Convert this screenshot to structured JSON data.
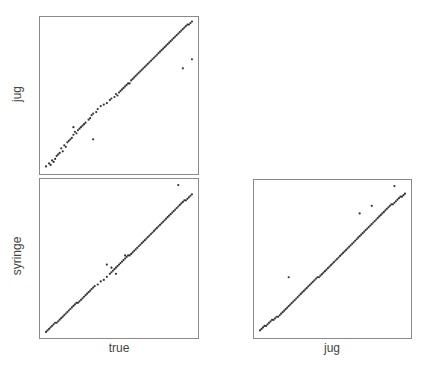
{
  "chart_data": [
    {
      "type": "scatter",
      "panel": "top-left",
      "xlabel": "true",
      "ylabel": "jug",
      "title": "",
      "grid": false,
      "ticks": false,
      "x": [
        0.02,
        0.04,
        0.05,
        0.06,
        0.07,
        0.08,
        0.09,
        0.1,
        0.11,
        0.12,
        0.13,
        0.14,
        0.15,
        0.16,
        0.17,
        0.18,
        0.19,
        0.2,
        0.21,
        0.22,
        0.23,
        0.24,
        0.25,
        0.26,
        0.27,
        0.28,
        0.3,
        0.31,
        0.32,
        0.33,
        0.35,
        0.36,
        0.38,
        0.4,
        0.42,
        0.44,
        0.45,
        0.47,
        0.48,
        0.49,
        0.5,
        0.51,
        0.52,
        0.53,
        0.54,
        0.55,
        0.56,
        0.57,
        0.58,
        0.59,
        0.6,
        0.61,
        0.62,
        0.63,
        0.64,
        0.65,
        0.66,
        0.67,
        0.68,
        0.69,
        0.7,
        0.71,
        0.72,
        0.73,
        0.74,
        0.75,
        0.76,
        0.77,
        0.78,
        0.79,
        0.8,
        0.81,
        0.82,
        0.83,
        0.84,
        0.85,
        0.86,
        0.87,
        0.88,
        0.89,
        0.9,
        0.91,
        0.92,
        0.93,
        0.94,
        0.95,
        0.96,
        0.97,
        0.98,
        0.33,
        0.92,
        0.98,
        0.2
      ],
      "y": [
        0.03,
        0.05,
        0.04,
        0.07,
        0.06,
        0.08,
        0.1,
        0.11,
        0.12,
        0.15,
        0.13,
        0.17,
        0.16,
        0.19,
        0.2,
        0.21,
        0.22,
        0.24,
        0.26,
        0.25,
        0.27,
        0.28,
        0.29,
        0.3,
        0.31,
        0.32,
        0.34,
        0.35,
        0.37,
        0.38,
        0.39,
        0.41,
        0.43,
        0.44,
        0.45,
        0.47,
        0.48,
        0.49,
        0.51,
        0.5,
        0.52,
        0.53,
        0.54,
        0.55,
        0.56,
        0.57,
        0.58,
        0.58,
        0.6,
        0.61,
        0.62,
        0.63,
        0.64,
        0.65,
        0.66,
        0.67,
        0.68,
        0.69,
        0.7,
        0.71,
        0.72,
        0.73,
        0.74,
        0.75,
        0.76,
        0.77,
        0.78,
        0.79,
        0.8,
        0.81,
        0.82,
        0.83,
        0.84,
        0.85,
        0.86,
        0.87,
        0.88,
        0.89,
        0.9,
        0.91,
        0.92,
        0.93,
        0.94,
        0.95,
        0.96,
        0.97,
        0.97,
        0.98,
        0.99,
        0.21,
        0.68,
        0.74,
        0.29
      ]
    },
    {
      "type": "scatter",
      "panel": "bottom-left",
      "xlabel": "true",
      "ylabel": "syringe",
      "title": "",
      "grid": false,
      "ticks": false,
      "x": [
        0.02,
        0.03,
        0.04,
        0.05,
        0.06,
        0.07,
        0.08,
        0.09,
        0.1,
        0.11,
        0.12,
        0.13,
        0.14,
        0.15,
        0.16,
        0.17,
        0.18,
        0.19,
        0.2,
        0.21,
        0.22,
        0.23,
        0.24,
        0.25,
        0.26,
        0.27,
        0.28,
        0.29,
        0.3,
        0.31,
        0.32,
        0.33,
        0.34,
        0.36,
        0.38,
        0.4,
        0.42,
        0.44,
        0.45,
        0.46,
        0.47,
        0.48,
        0.49,
        0.5,
        0.51,
        0.52,
        0.53,
        0.54,
        0.55,
        0.56,
        0.57,
        0.58,
        0.59,
        0.6,
        0.61,
        0.62,
        0.63,
        0.64,
        0.65,
        0.66,
        0.67,
        0.68,
        0.69,
        0.7,
        0.71,
        0.72,
        0.73,
        0.74,
        0.75,
        0.76,
        0.77,
        0.78,
        0.79,
        0.8,
        0.81,
        0.82,
        0.83,
        0.84,
        0.85,
        0.86,
        0.87,
        0.88,
        0.89,
        0.9,
        0.91,
        0.92,
        0.93,
        0.94,
        0.95,
        0.96,
        0.97,
        0.98,
        0.89,
        0.42,
        0.45,
        0.54,
        0.48
      ],
      "y": [
        0.02,
        0.03,
        0.04,
        0.05,
        0.06,
        0.07,
        0.08,
        0.08,
        0.09,
        0.1,
        0.11,
        0.12,
        0.13,
        0.14,
        0.15,
        0.16,
        0.17,
        0.18,
        0.19,
        0.2,
        0.21,
        0.21,
        0.22,
        0.23,
        0.24,
        0.25,
        0.26,
        0.27,
        0.28,
        0.29,
        0.3,
        0.31,
        0.32,
        0.33,
        0.35,
        0.36,
        0.38,
        0.4,
        0.41,
        0.42,
        0.43,
        0.44,
        0.45,
        0.46,
        0.47,
        0.48,
        0.49,
        0.5,
        0.51,
        0.52,
        0.52,
        0.53,
        0.54,
        0.55,
        0.56,
        0.57,
        0.58,
        0.59,
        0.6,
        0.61,
        0.62,
        0.63,
        0.64,
        0.65,
        0.66,
        0.67,
        0.68,
        0.69,
        0.7,
        0.71,
        0.72,
        0.73,
        0.74,
        0.75,
        0.76,
        0.77,
        0.78,
        0.79,
        0.8,
        0.81,
        0.82,
        0.83,
        0.84,
        0.85,
        0.86,
        0.87,
        0.88,
        0.88,
        0.89,
        0.9,
        0.91,
        0.92,
        0.98,
        0.46,
        0.44,
        0.52,
        0.4
      ]
    },
    {
      "type": "scatter",
      "panel": "bottom-right",
      "xlabel": "jug",
      "ylabel": "syringe",
      "title": "",
      "grid": false,
      "ticks": false,
      "x": [
        0.02,
        0.03,
        0.04,
        0.05,
        0.06,
        0.07,
        0.08,
        0.09,
        0.1,
        0.11,
        0.12,
        0.13,
        0.14,
        0.15,
        0.16,
        0.17,
        0.18,
        0.19,
        0.2,
        0.21,
        0.22,
        0.23,
        0.24,
        0.25,
        0.26,
        0.27,
        0.28,
        0.29,
        0.3,
        0.31,
        0.32,
        0.33,
        0.34,
        0.35,
        0.36,
        0.37,
        0.38,
        0.39,
        0.4,
        0.41,
        0.42,
        0.43,
        0.44,
        0.45,
        0.46,
        0.47,
        0.48,
        0.49,
        0.5,
        0.51,
        0.52,
        0.53,
        0.54,
        0.55,
        0.56,
        0.57,
        0.58,
        0.59,
        0.6,
        0.61,
        0.62,
        0.63,
        0.64,
        0.65,
        0.66,
        0.67,
        0.68,
        0.69,
        0.7,
        0.71,
        0.72,
        0.73,
        0.74,
        0.75,
        0.76,
        0.77,
        0.78,
        0.79,
        0.8,
        0.81,
        0.82,
        0.83,
        0.84,
        0.85,
        0.86,
        0.87,
        0.88,
        0.89,
        0.9,
        0.91,
        0.92,
        0.93,
        0.94,
        0.95,
        0.96,
        0.97,
        0.98,
        0.21,
        0.68,
        0.76,
        0.91
      ],
      "y": [
        0.03,
        0.04,
        0.05,
        0.06,
        0.06,
        0.07,
        0.08,
        0.09,
        0.1,
        0.1,
        0.11,
        0.12,
        0.12,
        0.13,
        0.14,
        0.15,
        0.16,
        0.17,
        0.18,
        0.19,
        0.2,
        0.21,
        0.22,
        0.23,
        0.24,
        0.25,
        0.26,
        0.27,
        0.28,
        0.29,
        0.3,
        0.31,
        0.32,
        0.33,
        0.34,
        0.35,
        0.36,
        0.37,
        0.38,
        0.38,
        0.39,
        0.4,
        0.41,
        0.42,
        0.43,
        0.44,
        0.45,
        0.46,
        0.47,
        0.48,
        0.49,
        0.5,
        0.51,
        0.52,
        0.53,
        0.54,
        0.55,
        0.56,
        0.57,
        0.58,
        0.59,
        0.6,
        0.61,
        0.62,
        0.63,
        0.64,
        0.65,
        0.66,
        0.67,
        0.68,
        0.69,
        0.7,
        0.71,
        0.72,
        0.73,
        0.74,
        0.75,
        0.76,
        0.77,
        0.78,
        0.79,
        0.8,
        0.81,
        0.82,
        0.83,
        0.84,
        0.85,
        0.86,
        0.86,
        0.87,
        0.88,
        0.89,
        0.9,
        0.91,
        0.91,
        0.92,
        0.93,
        0.38,
        0.8,
        0.85,
        0.98
      ]
    }
  ],
  "labels": {
    "top_left_ylabel": "jug",
    "bottom_left_ylabel": "syringe",
    "bottom_left_xlabel": "true",
    "bottom_right_xlabel": "jug"
  },
  "style": {
    "point_color": "#333333",
    "border_color": "#8a8a8a"
  }
}
